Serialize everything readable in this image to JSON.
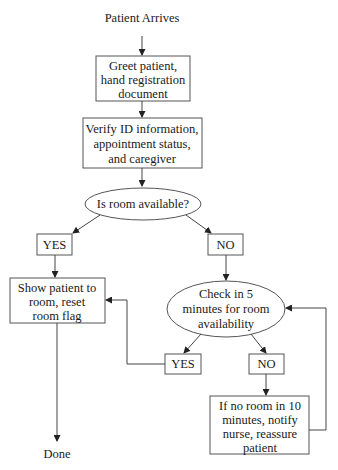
{
  "diagram": {
    "start_label": "Patient Arrives",
    "end_label": "Done",
    "nodes": {
      "greet": [
        "Greet patient,",
        "hand registration",
        "document"
      ],
      "verify": [
        "Verify ID information,",
        "appointment status,",
        "and caregiver"
      ],
      "room_available": "Is room available?",
      "yes1": "YES",
      "no1": "NO",
      "show_patient": [
        "Show patient to",
        "room, reset",
        "room flag"
      ],
      "check5": [
        "Check in 5",
        "minutes for room",
        "availability"
      ],
      "yes2": "YES",
      "no2": "NO",
      "notify": [
        "If no room in 10",
        "minutes, notify",
        "nurse, reassure",
        "patient"
      ]
    },
    "colors": {
      "stroke": "#555555",
      "text": "#1a1a1a",
      "background": "#ffffff"
    }
  }
}
